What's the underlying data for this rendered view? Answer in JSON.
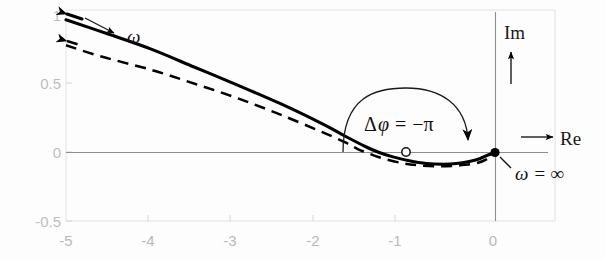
{
  "figure": {
    "type": "nyquist-plot",
    "title": "",
    "axis_labels": {
      "real": "Re",
      "imag": "Im"
    },
    "annotations": {
      "omega_label": "ω",
      "omega_infinity": "ω =  ∞",
      "phase_delta": "Δφ = −π",
      "phase_delta_parts": {
        "delta": "Δ",
        "phi": "φ",
        "equals": "=",
        "value": "−π"
      }
    },
    "colors": {
      "curve": "#000000",
      "axis": "#8d8d8d",
      "tick_text": "#bdbdbd",
      "background": "#fdfdfd"
    }
  },
  "chart_data": {
    "type": "line",
    "title": "",
    "xlabel": "Re",
    "ylabel": "Im",
    "xlim": [
      -5,
      0.6
    ],
    "ylim": [
      -0.5,
      1.0
    ],
    "grid": false,
    "legend": "none",
    "xticks": [
      -5,
      -4,
      -3,
      -2,
      -1,
      0
    ],
    "xtick_labels": [
      "-5",
      "-4",
      "-3",
      "-2",
      "-1",
      "0"
    ],
    "yticks": [
      -0.5,
      0,
      0.5,
      1
    ],
    "ytick_labels": [
      "-0.5",
      "0",
      "0.5",
      "1"
    ],
    "series": [
      {
        "name": "solid-locus",
        "style": "solid",
        "start_marker": "arrow",
        "end_marker": "filled-dot",
        "points": [
          [
            -5.0,
            0.965
          ],
          [
            -4.5,
            0.86
          ],
          [
            -4.0,
            0.75
          ],
          [
            -3.5,
            0.62
          ],
          [
            -3.0,
            0.49
          ],
          [
            -2.5,
            0.355
          ],
          [
            -2.0,
            0.205
          ],
          [
            -1.75,
            0.12
          ],
          [
            -1.5,
            0.04
          ],
          [
            -1.35,
            0.0
          ],
          [
            -1.2,
            -0.03
          ],
          [
            -1.0,
            -0.06
          ],
          [
            -0.8,
            -0.08
          ],
          [
            -0.6,
            -0.085
          ],
          [
            -0.45,
            -0.08
          ],
          [
            -0.3,
            -0.065
          ],
          [
            -0.18,
            -0.045
          ],
          [
            -0.08,
            -0.018
          ],
          [
            0.0,
            0.0
          ]
        ]
      },
      {
        "name": "dashed-locus",
        "style": "dashed",
        "start_marker": "arrow",
        "end_marker": "none",
        "points": [
          [
            -5.0,
            0.78
          ],
          [
            -4.6,
            0.7
          ],
          [
            -4.0,
            0.6
          ],
          [
            -3.5,
            0.5
          ],
          [
            -3.0,
            0.395
          ],
          [
            -2.5,
            0.275
          ],
          [
            -2.0,
            0.145
          ],
          [
            -1.75,
            0.075
          ],
          [
            -1.6,
            0.025
          ],
          [
            -1.5,
            0.0
          ],
          [
            -1.35,
            -0.035
          ],
          [
            -1.1,
            -0.075
          ],
          [
            -0.9,
            -0.093
          ],
          [
            -0.7,
            -0.1
          ],
          [
            -0.5,
            -0.098
          ],
          [
            -0.35,
            -0.09
          ],
          [
            -0.2,
            -0.075
          ],
          [
            -0.1,
            -0.05
          ],
          [
            0.0,
            0.0
          ]
        ]
      }
    ],
    "markers": [
      {
        "name": "critical-point",
        "x": -1.0,
        "y": 0.0,
        "style": "open-circle"
      },
      {
        "name": "omega-infinity-point",
        "x": 0.0,
        "y": 0.0,
        "style": "filled-dot",
        "label": "ω =  ∞"
      }
    ],
    "annotations": [
      {
        "name": "omega-direction-arrow",
        "text": "ω",
        "from": [
          -4.75,
          0.93
        ],
        "to": [
          -4.35,
          0.72
        ]
      },
      {
        "name": "phase-arc",
        "text": "Δφ = −π",
        "from": [
          -1.83,
          0.0
        ],
        "to": [
          -0.33,
          0.0
        ],
        "direction": "clockwise"
      }
    ]
  }
}
